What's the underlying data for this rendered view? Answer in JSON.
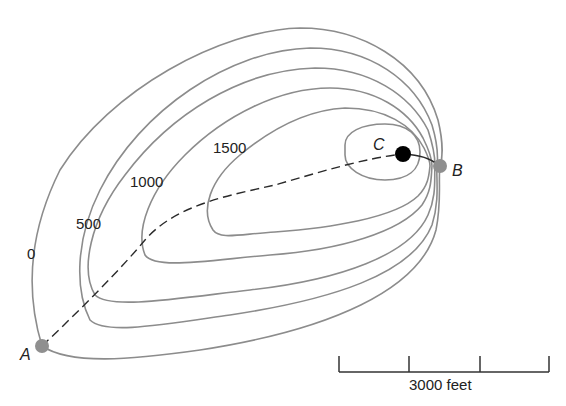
{
  "figure": {
    "type": "topographic contour map",
    "contour_labels": [
      {
        "value": "0",
        "x": 27,
        "y": 246
      },
      {
        "value": "500",
        "x": 76,
        "y": 216
      },
      {
        "value": "1000",
        "x": 130,
        "y": 174
      },
      {
        "value": "1500",
        "x": 213,
        "y": 140
      }
    ],
    "contour_interval_ft": 500,
    "points": {
      "A": {
        "label": "A",
        "color": "#8f8f8f",
        "x": 42,
        "y": 346
      },
      "B": {
        "label": "B",
        "color": "#8f8f8f",
        "x": 440,
        "y": 166
      },
      "C": {
        "label": "C",
        "color": "#000000",
        "x": 403,
        "y": 154
      }
    },
    "route": {
      "from": "A",
      "to": "B",
      "via": "C",
      "style_A_to_C": "dashed",
      "style_C_to_B": "solid"
    },
    "scale_bar": {
      "label": "3000 feet",
      "ticks": 4,
      "segments": 3
    },
    "colors": {
      "contour": "#8c8c8c",
      "route": "#2a2a2a",
      "background": "#ffffff"
    }
  }
}
